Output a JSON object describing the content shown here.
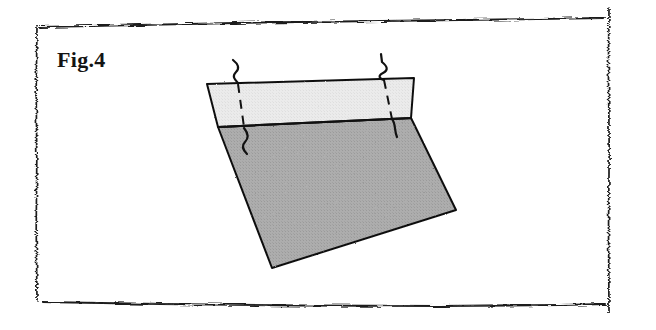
{
  "document": {
    "kind": "scanned-figure-page",
    "background_color": "#ffffff"
  },
  "figure": {
    "label": "Fig.4",
    "label_color": "#141414",
    "caption_position": "top-left"
  },
  "frame": {
    "name": "scanned-border-frame",
    "stroke_color": "#1a1a1a",
    "left_x": 36,
    "right_x": 609,
    "top_y": 22,
    "bottom_y": 303,
    "style": "noisy-photocopy-rule"
  },
  "diagram": {
    "name": "layered-block-with-wires",
    "outline_color": "#111111",
    "top_band": {
      "name": "upper-light-layer",
      "fill": "#e8e8e8",
      "vertices": [
        [
          207,
          84
        ],
        [
          414,
          78
        ],
        [
          411,
          118
        ],
        [
          218,
          127
        ]
      ]
    },
    "body": {
      "name": "lower-dark-layer",
      "fill": "#a8a8a8",
      "vertices": [
        [
          218,
          127
        ],
        [
          411,
          118
        ],
        [
          456,
          210
        ],
        [
          272,
          268
        ]
      ]
    },
    "divider": {
      "name": "layer-divider-line",
      "from": [
        218,
        127
      ],
      "to": [
        411,
        118
      ],
      "color": "#111111"
    },
    "wires": [
      {
        "name": "wire-left",
        "above_style": "solid-squiggle",
        "inside_style": "dashed",
        "below_style": "solid-wavy",
        "color": "#111111",
        "entry_x": 238,
        "entry_y": 82
      },
      {
        "name": "wire-right",
        "above_style": "solid-zigzag",
        "inside_style": "dashed",
        "below_style": "solid-stub",
        "color": "#111111",
        "entry_x": 384,
        "entry_y": 79
      }
    ]
  }
}
